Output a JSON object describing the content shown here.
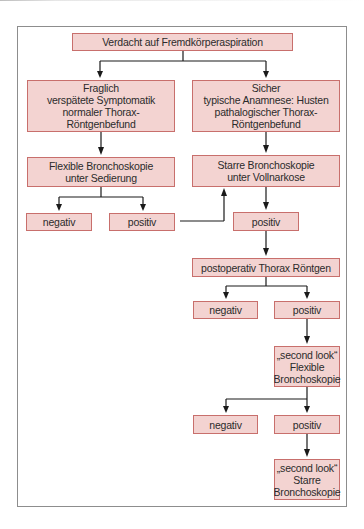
{
  "diagram": {
    "type": "flowchart",
    "colors": {
      "node_fill": "#f3d3d1",
      "node_border": "#c86f6c",
      "edge": "#1a1a1a",
      "frame": "#8d8d8d"
    },
    "nodes": {
      "root": "Verdacht auf Fremdkörperaspiration",
      "left_branch": "Fraglich\nverspätete Symptomatik\nnormaler Thorax-\nRöntgenbefund",
      "right_branch": "Sicher\ntypische Anamnese: Husten\npathalogischer Thorax-\nRöntgenbefund",
      "flexible_bronchoscopy": "Flexible Bronchoskopie\nunter Sedierung",
      "rigid_bronchoscopy": "Starre Bronchoskopie\nunter Vollnarkose",
      "flex_negative": "negativ",
      "flex_positive": "positiv",
      "rigid_positive": "positiv",
      "postop_xray": "postoperativ Thorax Röntgen",
      "xray_negative": "negativ",
      "xray_positive": "positiv",
      "second_look_flexible": "„second look“\nFlexible\nBronchoskopie",
      "second_flex_negative": "negativ",
      "second_flex_positive": "positiv",
      "second_look_rigid": "„second look“\nStarre\nBronchoskopie"
    },
    "edges": [
      {
        "from": "root",
        "to": "left_branch"
      },
      {
        "from": "root",
        "to": "right_branch"
      },
      {
        "from": "left_branch",
        "to": "flexible_bronchoscopy"
      },
      {
        "from": "right_branch",
        "to": "rigid_bronchoscopy"
      },
      {
        "from": "flexible_bronchoscopy",
        "to": "flex_negative"
      },
      {
        "from": "flexible_bronchoscopy",
        "to": "flex_positive"
      },
      {
        "from": "flex_positive",
        "to": "rigid_bronchoscopy"
      },
      {
        "from": "rigid_bronchoscopy",
        "to": "rigid_positive"
      },
      {
        "from": "rigid_positive",
        "to": "postop_xray"
      },
      {
        "from": "postop_xray",
        "to": "xray_negative"
      },
      {
        "from": "postop_xray",
        "to": "xray_positive"
      },
      {
        "from": "xray_positive",
        "to": "second_look_flexible"
      },
      {
        "from": "second_look_flexible",
        "to": "second_flex_negative"
      },
      {
        "from": "second_look_flexible",
        "to": "second_flex_positive"
      },
      {
        "from": "second_flex_positive",
        "to": "second_look_rigid"
      }
    ]
  }
}
